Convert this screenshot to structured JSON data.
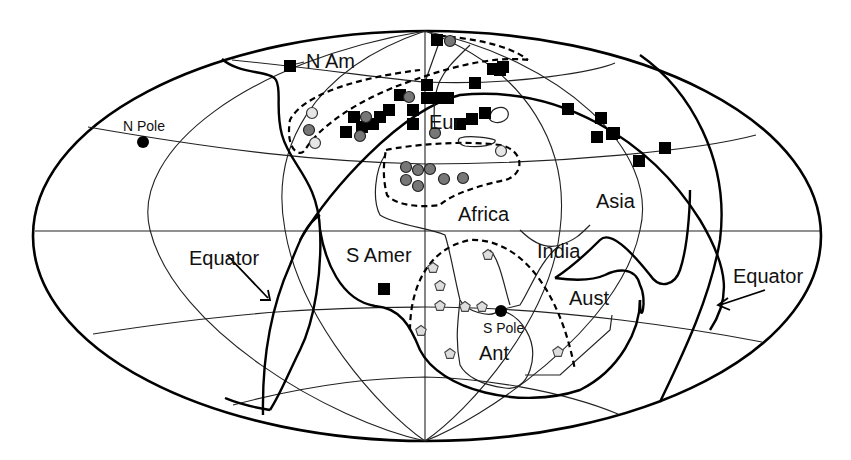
{
  "map": {
    "projection": "Mollweide-style ellipse (paleogeographic reconstruction)",
    "labels": {
      "n_am": "N Am",
      "eur": "Eur",
      "africa": "Africa",
      "asia": "Asia",
      "s_amer": "S Amer",
      "india": "India",
      "aust": "Aust",
      "ant": "Ant",
      "n_pole": "N Pole",
      "s_pole": "S Pole",
      "equator_left": "Equator",
      "equator_right": "Equator"
    },
    "marker_types": [
      {
        "name": "black-square",
        "color": "#000000"
      },
      {
        "name": "dark-gray-circle",
        "color": "#777777"
      },
      {
        "name": "light-gray-circle",
        "color": "#e6e6e6"
      },
      {
        "name": "gray-pentagon",
        "color": "#dddddd"
      },
      {
        "name": "pole-dot",
        "color": "#000000"
      }
    ],
    "squares": [
      [
        290,
        66
      ],
      [
        437,
        40
      ],
      [
        493,
        69
      ],
      [
        503,
        67
      ],
      [
        354,
        117
      ],
      [
        362,
        127
      ],
      [
        373,
        124
      ],
      [
        380,
        117
      ],
      [
        389,
        110
      ],
      [
        346,
        132
      ],
      [
        413,
        110
      ],
      [
        413,
        124
      ],
      [
        427,
        98
      ],
      [
        427,
        85
      ],
      [
        438,
        98
      ],
      [
        448,
        98
      ],
      [
        460,
        124
      ],
      [
        472,
        119
      ],
      [
        485,
        113
      ],
      [
        500,
        70
      ],
      [
        475,
        83
      ],
      [
        568,
        109
      ],
      [
        601,
        118
      ],
      [
        614,
        133
      ],
      [
        597,
        137
      ],
      [
        612,
        134
      ],
      [
        665,
        148
      ],
      [
        639,
        161
      ],
      [
        384,
        289
      ],
      [
        400,
        95
      ]
    ],
    "dark_circles": [
      [
        450,
        41
      ],
      [
        309,
        130
      ],
      [
        366,
        117
      ],
      [
        360,
        136
      ],
      [
        409,
        97
      ],
      [
        406,
        167
      ],
      [
        418,
        170
      ],
      [
        406,
        180
      ],
      [
        418,
        186
      ],
      [
        430,
        169
      ],
      [
        444,
        179
      ],
      [
        463,
        178
      ],
      [
        435,
        133
      ]
    ],
    "light_circles": [
      [
        312,
        113
      ],
      [
        315,
        143
      ],
      [
        501,
        151
      ]
    ],
    "pentagons": [
      [
        488,
        255
      ],
      [
        433,
        268
      ],
      [
        440,
        286
      ],
      [
        440,
        306
      ],
      [
        465,
        307
      ],
      [
        482,
        307
      ],
      [
        421,
        331
      ],
      [
        450,
        354
      ],
      [
        558,
        352
      ]
    ],
    "poles": {
      "north": [
        143,
        142
      ],
      "south": [
        501,
        311
      ]
    }
  }
}
